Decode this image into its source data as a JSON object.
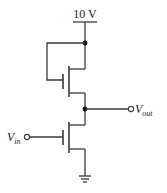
{
  "diagram": {
    "type": "circuit",
    "title": "",
    "supply": {
      "label": "10 V"
    },
    "input": {
      "label_main": "V",
      "label_sub": "in"
    },
    "output": {
      "label_main": "V",
      "label_sub": "out"
    },
    "components": [
      {
        "id": "M1",
        "kind": "nmos",
        "role": "load",
        "connection": "gate tied to drain (10 V)"
      },
      {
        "id": "M2",
        "kind": "nmos",
        "role": "driver",
        "connection": "gate = Vin, source = ground"
      }
    ],
    "nodes": [
      "10 V supply",
      "Vout (M1 source / M2 drain)",
      "ground"
    ],
    "colors": {
      "line": "#3a3a3a",
      "background": "#ffffff"
    }
  }
}
